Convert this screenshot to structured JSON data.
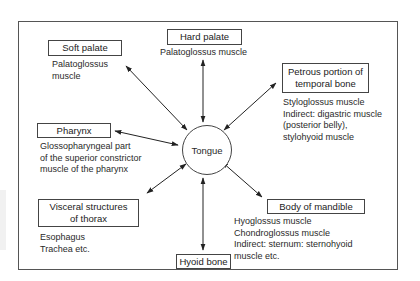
{
  "diagram": {
    "center": {
      "label": "Tongue"
    },
    "nodes": [
      {
        "id": "soft-palate",
        "title": "Soft palate",
        "lines": [
          "Palatoglossus",
          "muscle"
        ]
      },
      {
        "id": "hard-palate",
        "title": "Hard palate",
        "lines": [
          "Palatoglossus muscle"
        ]
      },
      {
        "id": "petrous",
        "title_lines": [
          "Petrous portion of",
          "temporal bone"
        ],
        "lines": [
          "Styloglossus muscle",
          "Indirect: digastric muscle",
          "(posterior belly),",
          "stylohyoid muscle"
        ]
      },
      {
        "id": "pharynx",
        "title": "Pharynx",
        "lines": [
          "Glossopharyngeal part",
          "of the superior constrictor",
          "muscle of the pharynx"
        ]
      },
      {
        "id": "visceral",
        "title_lines": [
          "Visceral structures",
          "of thorax"
        ],
        "lines": [
          "Esophagus",
          "Trachea etc."
        ]
      },
      {
        "id": "mandible",
        "title": "Body of mandible",
        "lines": [
          "Hyoglossus muscle",
          "Chondroglossus muscle",
          "Indirect: sternum: sternohyoid",
          "muscle etc."
        ]
      },
      {
        "id": "hyoid",
        "title": "Hyoid bone",
        "lines": []
      }
    ],
    "arrow_style": "double-headed",
    "colors": {
      "line": "#222222",
      "border": "#444444",
      "background": "#ffffff"
    }
  }
}
